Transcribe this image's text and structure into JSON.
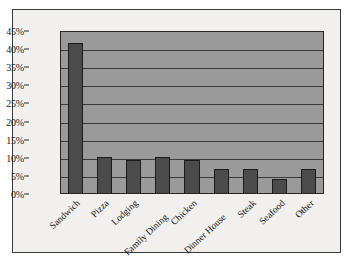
{
  "chart_data": {
    "type": "bar",
    "title": "",
    "subtitle": "",
    "xlabel": "",
    "ylabel": "",
    "ylim": [
      0,
      45
    ],
    "ytick_step": 5,
    "grid": true,
    "legend": false,
    "value_suffix": "%",
    "categories": [
      "Sandwich",
      "Pizza",
      "Lodging",
      "Family Dining",
      "Chicken",
      "Dinner House",
      "Steak",
      "Seafood",
      "Other"
    ],
    "values": [
      41.5,
      10,
      9,
      10,
      9,
      6.5,
      6.5,
      4,
      6.5
    ],
    "ytick_labels": [
      "45%",
      "40%",
      "35%",
      "30%",
      "25%",
      "20%",
      "15%",
      "10%",
      "5%",
      "0%"
    ],
    "ytick_values": [
      45,
      40,
      35,
      30,
      25,
      20,
      15,
      10,
      5,
      0
    ],
    "colors": {
      "bar_fill": "#4b4b4b",
      "bar_stroke": "#1c1c1c",
      "plot_background": "#9a9a9a",
      "figure_background": "#f1f0ee",
      "gridline": "#3c3c3c",
      "axis_text": "#1b1b1b",
      "frame_border": "#3a3a3a"
    },
    "label_rotation_degrees": -43,
    "staggered_labels": [
      "Family Dining",
      "Dinner House"
    ]
  }
}
